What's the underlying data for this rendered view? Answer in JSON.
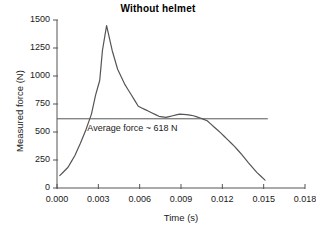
{
  "chart_data": {
    "type": "line",
    "title": "Without helmet",
    "xlabel": "Time (s)",
    "ylabel": "Measured force (N)",
    "xlim": [
      0.0,
      0.018
    ],
    "ylim": [
      0,
      1500
    ],
    "xticks": [
      "0.000",
      "0.003",
      "0.006",
      "0.009",
      "0.012",
      "0.015",
      "0.018"
    ],
    "xtick_values": [
      0.0,
      0.003,
      0.006,
      0.009,
      0.012,
      0.015,
      0.018
    ],
    "yticks": [
      "0",
      "250",
      "500",
      "750",
      "1000",
      "1250",
      "1500"
    ],
    "ytick_values": [
      0,
      250,
      500,
      750,
      1000,
      1250,
      1500
    ],
    "grid": false,
    "legend": null,
    "series": [
      {
        "name": "Measured force",
        "color": "#555555",
        "x": [
          0.0002,
          0.0008,
          0.0013,
          0.0017,
          0.0021,
          0.0025,
          0.0028,
          0.0031,
          0.0033,
          0.0036,
          0.004,
          0.0044,
          0.0049,
          0.0054,
          0.0059,
          0.0064,
          0.0069,
          0.0074,
          0.0079,
          0.0084,
          0.0089,
          0.0094,
          0.0099,
          0.0104,
          0.0109,
          0.0114,
          0.0119,
          0.0124,
          0.0129,
          0.0134,
          0.0139,
          0.0145,
          0.0151
        ],
        "y": [
          110,
          185,
          290,
          400,
          520,
          660,
          830,
          960,
          1230,
          1450,
          1230,
          1060,
          930,
          830,
          730,
          700,
          670,
          640,
          630,
          645,
          660,
          655,
          645,
          625,
          600,
          545,
          490,
          430,
          370,
          300,
          225,
          140,
          70
        ]
      }
    ],
    "reference_line": {
      "label": "Average force ~ 618 N",
      "value": 618,
      "orientation": "horizontal",
      "color": "#555555",
      "x_start": 0.0,
      "x_end": 0.0153,
      "label_x": 0.0022,
      "label_y": 520
    },
    "annotations": [
      {
        "text": "Average force ~ 618 N",
        "x": 0.0022,
        "y": 520
      }
    ]
  },
  "style": {
    "axis_color": "#555555",
    "text_color": "#1a1a1a",
    "background": "#ffffff"
  }
}
